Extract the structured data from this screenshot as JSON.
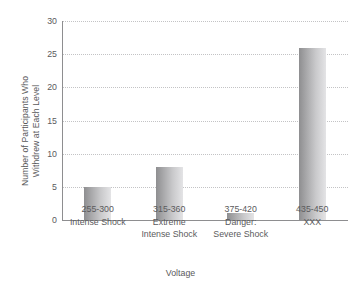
{
  "chart_data": {
    "type": "bar",
    "title": "",
    "xlabel": "Voltage",
    "ylabel": "Number of Participants Who Withdrew at Each Level",
    "ylabel_lines": [
      "Number of Participants Who",
      "Withdrew at Each Level"
    ],
    "categories": [
      "255-300",
      "315-360",
      "375-420",
      "435-450"
    ],
    "category_descriptions": [
      [
        "Intense Shock"
      ],
      [
        "Extreme",
        "Intense Shock"
      ],
      [
        "Danger:",
        "Severe Shock"
      ],
      [
        "XXX"
      ]
    ],
    "values": [
      5,
      8,
      1,
      26
    ],
    "ylim": [
      0,
      30
    ],
    "ytick_labels": [
      "0",
      "5",
      "10",
      "15",
      "20",
      "25",
      "30"
    ],
    "ytick_values": [
      0,
      5,
      10,
      15,
      20,
      25,
      30
    ],
    "grid": true,
    "grid_style": "dotted",
    "legend": "none",
    "colors": {
      "bar_dark": "#8e8e90",
      "bar_light": "#e4e4e6",
      "axis": "#8e8e90",
      "grid": "#c3c3c5",
      "text": "#5b5b5d",
      "background": "#ffffff"
    }
  }
}
